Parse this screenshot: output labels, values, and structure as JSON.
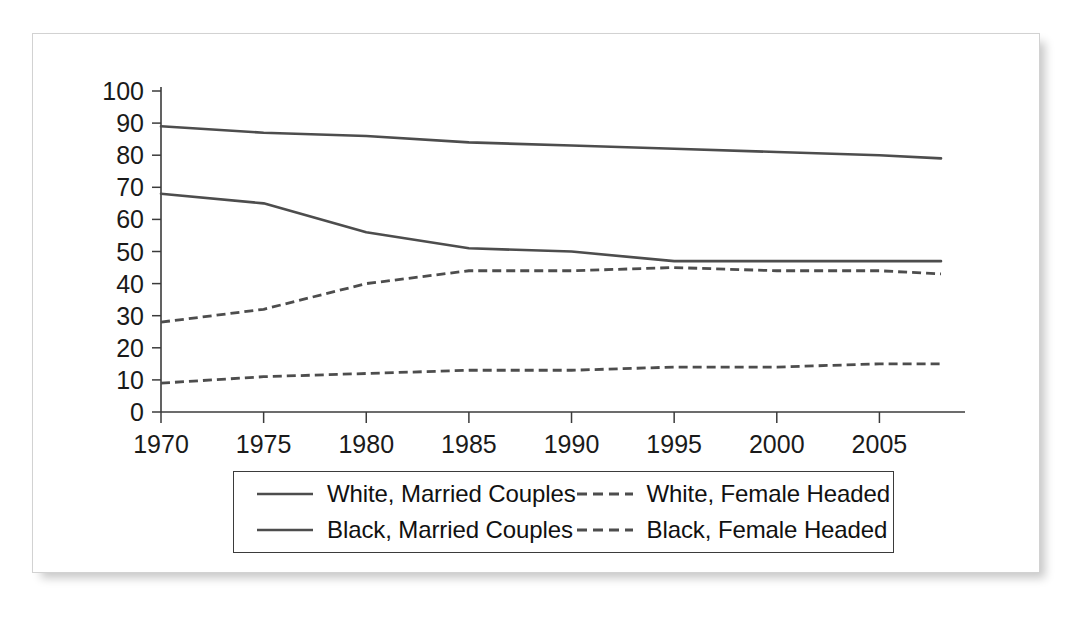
{
  "figure": {
    "frame_border_color": "#d2d2d2",
    "background_color": "#ffffff",
    "line_color": "#4d4d4d",
    "axis_color": "#3b3b3b"
  },
  "chart_data": {
    "type": "line",
    "title": "",
    "subtitle": "",
    "xlabel": "",
    "ylabel": "",
    "xlim": [
      1970,
      2008
    ],
    "ylim": [
      0,
      100
    ],
    "grid": false,
    "legend_position": "bottom",
    "x_tick_labels": [
      "1970",
      "1975",
      "1980",
      "1985",
      "1990",
      "1995",
      "2000",
      "2005"
    ],
    "x_ticks": [
      1970,
      1975,
      1980,
      1985,
      1990,
      1995,
      2000,
      2005
    ],
    "y_tick_labels": [
      "0",
      "10",
      "20",
      "30",
      "40",
      "50",
      "60",
      "70",
      "80",
      "90",
      "100"
    ],
    "y_ticks": [
      0,
      10,
      20,
      30,
      40,
      50,
      60,
      70,
      80,
      90,
      100
    ],
    "x": [
      1970,
      1975,
      1980,
      1985,
      1990,
      1995,
      2000,
      2005,
      2008
    ],
    "series": [
      {
        "name": "White, Married Couples",
        "style": "solid",
        "color": "#4d4d4d",
        "values": [
          89,
          87,
          86,
          84,
          83,
          82,
          81,
          80,
          79
        ]
      },
      {
        "name": "Black, Married Couples",
        "style": "solid",
        "color": "#4d4d4d",
        "values": [
          68,
          65,
          56,
          51,
          50,
          47,
          47,
          47,
          47
        ]
      },
      {
        "name": "White, Female Headed",
        "style": "dashed",
        "color": "#4d4d4d",
        "values": [
          28,
          32,
          40,
          44,
          44,
          45,
          44,
          44,
          43
        ]
      },
      {
        "name": "Black, Female Headed",
        "style": "dashed",
        "color": "#4d4d4d",
        "values": [
          9,
          11,
          12,
          13,
          13,
          14,
          14,
          15,
          15
        ]
      }
    ]
  },
  "legend": {
    "items": [
      {
        "label": "White, Married Couples",
        "style": "solid"
      },
      {
        "label": "White, Female Headed",
        "style": "dashed"
      },
      {
        "label": "Black, Married Couples",
        "style": "solid"
      },
      {
        "label": "Black, Female Headed",
        "style": "dashed"
      }
    ]
  }
}
